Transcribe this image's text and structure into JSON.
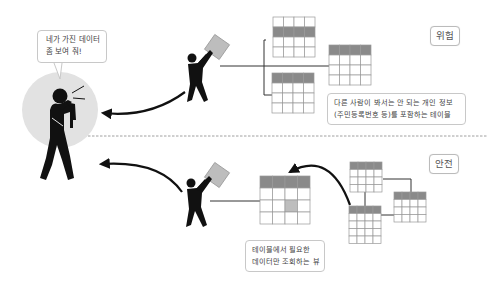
{
  "speech_bubble": {
    "line1": "네가 가진 데이터",
    "line2": "좀 보여 줘!"
  },
  "sections": {
    "danger": {
      "badge": "위험",
      "caption_line1": "다른 사람이 봐서는 안 되는 개인 정보",
      "caption_line2": "(주민등록번호 등)를 포함하는 테이블"
    },
    "safe": {
      "badge": "안전",
      "caption_line1": "테이블에서 필요한",
      "caption_line2": "데이터만 조회하는 뷰"
    }
  },
  "colors": {
    "header_fill": "#8a8a8a",
    "highlight_cell": "#bdbdbd",
    "box_fill": "#bdbdbd",
    "circle_fill": "#e2e2e2",
    "figure": "#111111",
    "grid_line": "#999999"
  }
}
